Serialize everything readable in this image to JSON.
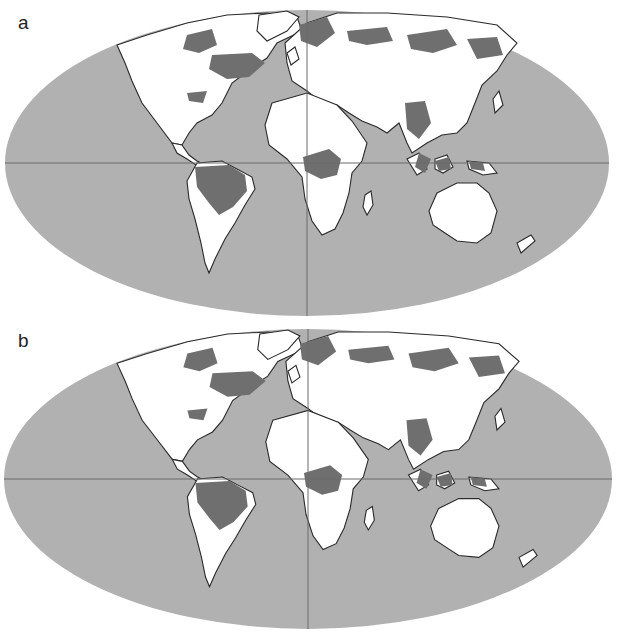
{
  "figure": {
    "panels": [
      {
        "label": "a",
        "projection": "Mollweide",
        "legend_classes": [
          "ocean",
          "land",
          "forest/habitat"
        ]
      },
      {
        "label": "b",
        "projection": "Mollweide",
        "legend_classes": [
          "ocean",
          "land",
          "forest/habitat"
        ]
      }
    ],
    "colors": {
      "ocean": "#b1b1b1",
      "land": "#ffffff",
      "highlight": "#6f6f6f",
      "border": "#2a2a2a",
      "graticule": "#6a6a6a"
    }
  }
}
